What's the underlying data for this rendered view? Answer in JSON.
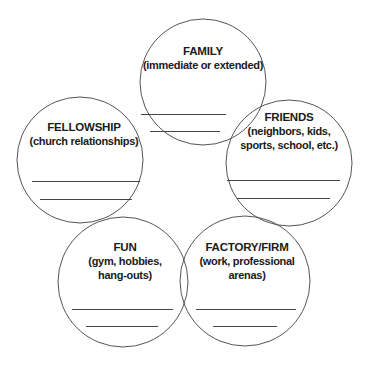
{
  "diagram": {
    "type": "five-circle-overlapping-venn",
    "stroke_color": "#555555",
    "circles": [
      {
        "id": "family",
        "title": "FAMILY",
        "subtitle": "(immediate or extended)",
        "cx": 203,
        "cy": 82,
        "r": 63
      },
      {
        "id": "fellowship",
        "title": "FELLOWSHIP",
        "subtitle": "(church relationships)",
        "cx": 80,
        "cy": 160,
        "r": 63
      },
      {
        "id": "friends",
        "title": "FRIENDS",
        "subtitle_line1": "(neighbors, kids,",
        "subtitle_line2": "sports, school, etc.)",
        "cx": 289,
        "cy": 163,
        "r": 63
      },
      {
        "id": "fun",
        "title": "FUN",
        "subtitle_line1": "(gym, hobbies,",
        "subtitle_line2": "hang-outs)",
        "cx": 123,
        "cy": 282,
        "r": 65
      },
      {
        "id": "factory",
        "title": "FACTORY/FIRM",
        "subtitle_line1": "(work, professional",
        "subtitle_line2": "arenas)",
        "cx": 245,
        "cy": 281,
        "r": 65
      }
    ],
    "blank_lines_per_circle": 2
  }
}
